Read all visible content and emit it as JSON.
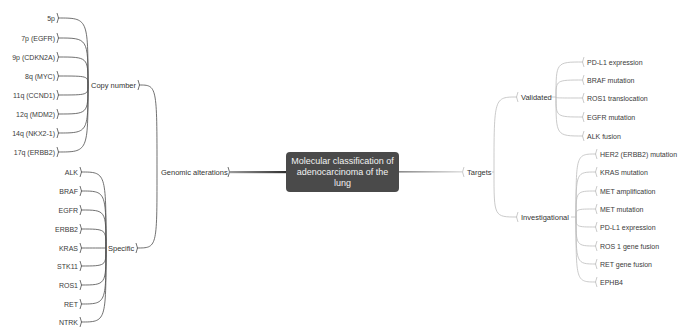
{
  "center": {
    "title": "Molecular classification of adenocarcinoma of the lung"
  },
  "left": {
    "label": "Genomic alterations",
    "groups": [
      {
        "label": "Copy number",
        "items": [
          "5p",
          "7p (EGFR)",
          "9p (CDKN2A)",
          "8q (MYC)",
          "11q (CCND1)",
          "12q (MDM2)",
          "14q (NKX2-1)",
          "17q (ERBB2)"
        ]
      },
      {
        "label": "Specific",
        "items": [
          "ALK",
          "BRAF",
          "EGFR",
          "ERBB2",
          "KRAS",
          "STK11",
          "ROS1",
          "RET",
          "NTRK"
        ]
      }
    ]
  },
  "right": {
    "label": "Targets",
    "groups": [
      {
        "label": "Validated",
        "items": [
          "PD-L1 expression",
          "BRAF mutation",
          "ROS1 translocation",
          "EGFR mutation",
          "ALK fusion"
        ]
      },
      {
        "label": "Investigational",
        "items": [
          "HER2 (ERBB2) mutation",
          "KRAS mutation",
          "MET amplification",
          "MET mutation",
          "PD-L1 expression",
          "ROS 1 gene fusion",
          "RET gene fusion",
          "EPHB4"
        ]
      }
    ]
  },
  "colors": {
    "left_line": "#4d4d4d",
    "right_line": "#bdbdbd",
    "center_fill": "#4a4a4a",
    "center_text": "#f2f2f2"
  }
}
